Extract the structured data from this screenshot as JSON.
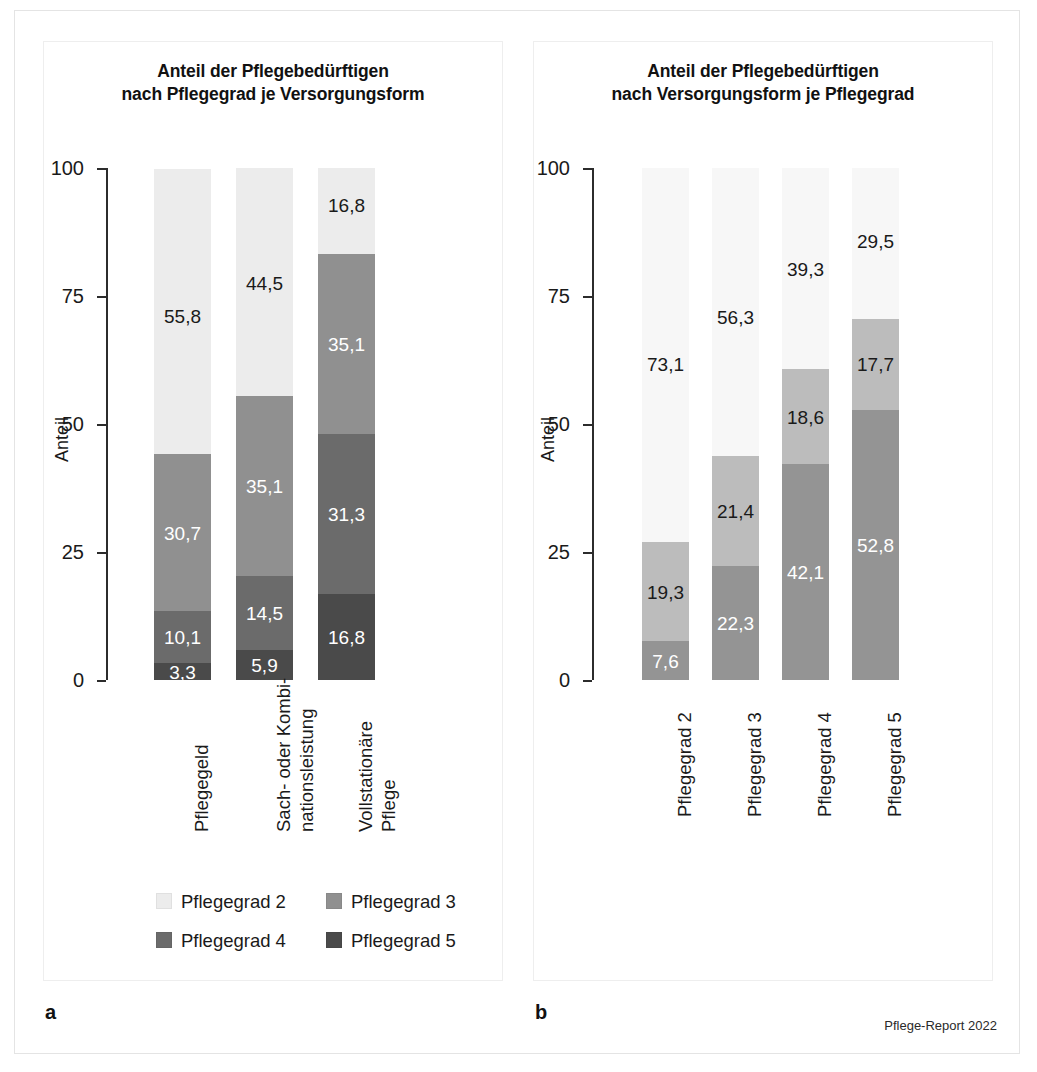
{
  "figure": {
    "credit": "Pflege-Report 2022",
    "panel_a_letter": "a",
    "panel_b_letter": "b"
  },
  "colors": {
    "pg2": "#ececec",
    "pg3": "#909090",
    "pg4": "#6b6b6b",
    "pg5": "#4a4a4a",
    "pflegegeld": "#f7f7f7",
    "sach_kombi": "#bcbcbc",
    "vollstationaer": "#949494",
    "axis": "#2c2c2c",
    "frame": "#e4e4e4"
  },
  "panel_a": {
    "title": "Anteil der Pflegebedürftigen\nnach Pflegegrad je Versorgungsform",
    "axis_title": "Anteil",
    "tick_labels": [
      "100",
      "75",
      "50",
      "25",
      "0"
    ],
    "categories": [
      "Pflegegeld",
      "Sach- oder Kombi-\nnationsleistung",
      "Vollstationäre\nPflege"
    ],
    "legend": [
      {
        "label": "Pflegegrad 2",
        "color": "#ececec"
      },
      {
        "label": "Pflegegrad 3",
        "color": "#909090"
      },
      {
        "label": "Pflegegrad 4",
        "color": "#6b6b6b"
      },
      {
        "label": "Pflegegrad 5",
        "color": "#4a4a4a"
      }
    ]
  },
  "panel_b": {
    "title": "Anteil der Pflegebedürftigen\nnach Versorgungsform je Pflegegrad",
    "axis_title": "Anteil",
    "tick_labels": [
      "100",
      "75",
      "50",
      "25",
      "0"
    ],
    "categories": [
      "Pflegegrad 2",
      "Pflegegrad 3",
      "Pflegegrad 4",
      "Pflegegrad 5"
    ],
    "legend": [
      {
        "label": "Pflegegeld",
        "color": "#f7f7f7"
      },
      {
        "label": "Sach- oder Kombi-\nnationsleistung",
        "color": "#bcbcbc"
      },
      {
        "label": "Vollstationäre\nPflege",
        "color": "#949494"
      }
    ]
  },
  "chart_data": [
    {
      "type": "bar",
      "stacked": true,
      "panel": "a",
      "title": "Anteil der Pflegebedürftigen nach Pflegegrad je Versorgungsform",
      "xlabel": "",
      "ylabel": "Anteil",
      "ylim": [
        0,
        100
      ],
      "yticks": [
        0,
        25,
        50,
        75,
        100
      ],
      "grid": false,
      "legend_position": "bottom",
      "categories": [
        "Pflegegeld",
        "Sach- oder Kombinationsleistung",
        "Vollstationäre Pflege"
      ],
      "series": [
        {
          "name": "Pflegegrad 5",
          "color": "#4a4a4a",
          "values": [
            3.3,
            5.9,
            16.8
          ],
          "labels": [
            "3,3",
            "5,9",
            "16,8"
          ]
        },
        {
          "name": "Pflegegrad 4",
          "color": "#6b6b6b",
          "values": [
            10.1,
            14.5,
            31.3
          ],
          "labels": [
            "10,1",
            "14,5",
            "31,3"
          ]
        },
        {
          "name": "Pflegegrad 3",
          "color": "#909090",
          "values": [
            30.7,
            35.1,
            35.1
          ],
          "labels": [
            "30,7",
            "35,1",
            "35,1"
          ]
        },
        {
          "name": "Pflegegrad 2",
          "color": "#ececec",
          "values": [
            55.8,
            44.5,
            16.8
          ],
          "labels": [
            "55,8",
            "44,5",
            "16,8"
          ]
        }
      ]
    },
    {
      "type": "bar",
      "stacked": true,
      "panel": "b",
      "title": "Anteil der Pflegebedürftigen nach Versorgungsform je Pflegegrad",
      "xlabel": "",
      "ylabel": "Anteil",
      "ylim": [
        0,
        100
      ],
      "yticks": [
        0,
        25,
        50,
        75,
        100
      ],
      "grid": false,
      "legend_position": "bottom",
      "categories": [
        "Pflegegrad 2",
        "Pflegegrad 3",
        "Pflegegrad 4",
        "Pflegegrad 5"
      ],
      "series": [
        {
          "name": "Vollstationäre Pflege",
          "color": "#949494",
          "values": [
            7.6,
            22.3,
            42.1,
            52.8
          ],
          "labels": [
            "7,6",
            "22,3",
            "42,1",
            "52,8"
          ]
        },
        {
          "name": "Sach- oder Kombinationsleistung",
          "color": "#bcbcbc",
          "values": [
            19.3,
            21.4,
            18.6,
            17.7
          ],
          "labels": [
            "19,3",
            "21,4",
            "18,6",
            "17,7"
          ]
        },
        {
          "name": "Pflegegeld",
          "color": "#f7f7f7",
          "values": [
            73.1,
            56.3,
            39.3,
            29.5
          ],
          "labels": [
            "73,1",
            "56,3",
            "39,3",
            "29,5"
          ]
        }
      ]
    }
  ]
}
